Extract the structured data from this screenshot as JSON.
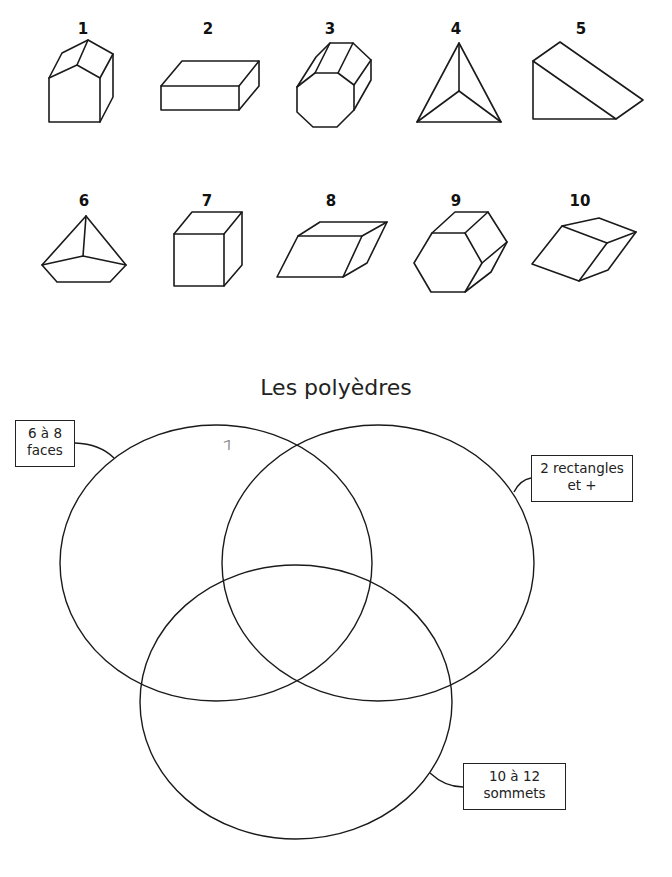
{
  "shapes": [
    {
      "number": "1",
      "name": "pentagonal-prism"
    },
    {
      "number": "2",
      "name": "rectangular-prism"
    },
    {
      "number": "3",
      "name": "octagonal-prism"
    },
    {
      "number": "4",
      "name": "triangular-pyramid"
    },
    {
      "number": "5",
      "name": "triangular-prism"
    },
    {
      "number": "6",
      "name": "pentagonal-pyramid"
    },
    {
      "number": "7",
      "name": "cube"
    },
    {
      "number": "8",
      "name": "parallelepiped"
    },
    {
      "number": "9",
      "name": "hexagonal-prism"
    },
    {
      "number": "10",
      "name": "rhombic-prism"
    }
  ],
  "venn": {
    "title": "Les polyèdres",
    "sets": [
      {
        "line1": "6 à 8",
        "line2": "faces"
      },
      {
        "line1": "2 rectangles",
        "line2": "et +"
      },
      {
        "line1": "10 à 12",
        "line2": "sommets"
      }
    ],
    "handwritten_mark": "7"
  }
}
